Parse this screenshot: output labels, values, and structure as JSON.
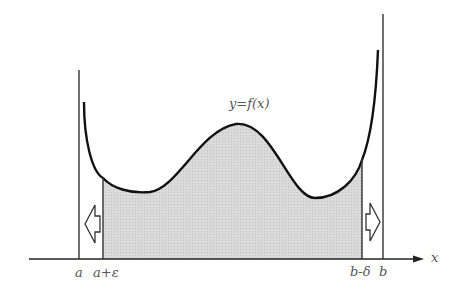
{
  "figure": {
    "curve_label": "y=f(x)",
    "x_axis_label": "x",
    "tick_labels": {
      "a": "a",
      "a_plus_eps": "a+ε",
      "b_minus_delta": "b-δ",
      "b": "b"
    },
    "arrows": [
      {
        "direction": "left",
        "near": "a+ε"
      },
      {
        "direction": "right",
        "near": "b-δ"
      }
    ],
    "colors": {
      "curve": "#111111",
      "shade": "#d6d6d6",
      "lines": "#222222",
      "labels": "#555555"
    }
  }
}
